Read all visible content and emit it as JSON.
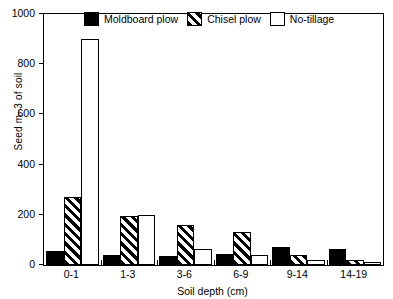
{
  "chart_data": {
    "type": "bar",
    "title": "",
    "xlabel": "Soil depth (cm)",
    "ylabel": "Seed m−3 of soil",
    "categories": [
      "0-1",
      "1-3",
      "3-6",
      "6-9",
      "9-14",
      "14-19"
    ],
    "series": [
      {
        "name": "Moldboard plow",
        "values": [
          55,
          40,
          35,
          45,
          70,
          65
        ],
        "fill": "solid-black"
      },
      {
        "name": "Chisel plow",
        "values": [
          270,
          195,
          160,
          130,
          40,
          18
        ],
        "fill": "diagonal-hatch"
      },
      {
        "name": "No-tillage",
        "values": [
          900,
          200,
          65,
          40,
          20,
          12
        ],
        "fill": "white"
      }
    ],
    "ylim": [
      0,
      1000
    ],
    "yticks": [
      0,
      200,
      400,
      600,
      800,
      1000
    ],
    "ytick_labels": [
      "0",
      "200",
      "400",
      "600",
      "800",
      "1000"
    ],
    "grid": false,
    "legend_position": "top-inside"
  },
  "legend": {
    "items": [
      {
        "label": "Moldboard plow",
        "swatch": "solid-black"
      },
      {
        "label": "Chisel plow",
        "swatch": "diagonal-hatch"
      },
      {
        "label": "No-tillage",
        "swatch": "white"
      }
    ]
  },
  "colors": {
    "foreground": "#000000",
    "background": "#ffffff"
  }
}
